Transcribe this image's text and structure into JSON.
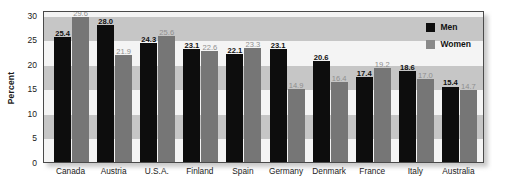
{
  "chart_data": {
    "type": "bar",
    "title": "",
    "subtitle": "",
    "xlabel": "",
    "ylabel": "Percent",
    "ylim": [
      0,
      31
    ],
    "yticks": [
      0,
      5,
      10,
      15,
      20,
      25,
      30
    ],
    "ytick_labels": [
      "0",
      "5",
      "10",
      "15",
      "20",
      "25",
      "30"
    ],
    "grid": "alternating horizontal bands every 5 units",
    "legend_position": "top-right inside plot",
    "categories": [
      "Canada",
      "Austria",
      "U.S.A.",
      "Finland",
      "Spain",
      "Germany",
      "Denmark",
      "France",
      "Italy",
      "Australia"
    ],
    "series": [
      {
        "name": "Men",
        "color": "#0d0d0d",
        "values": [
          25.4,
          28.0,
          24.3,
          23.1,
          22.1,
          23.1,
          20.6,
          17.4,
          18.6,
          15.4
        ],
        "labels": [
          "25.4",
          "28.0",
          "24.3",
          "23.1",
          "22.1",
          "23.1",
          "20.6",
          "17.4",
          "18.6",
          "15.4"
        ]
      },
      {
        "name": "Women",
        "color": "#767676",
        "values": [
          29.6,
          21.9,
          25.6,
          22.6,
          23.3,
          14.9,
          16.4,
          19.2,
          17.0,
          14.7
        ],
        "labels": [
          "29.6",
          "21.9",
          "25.6",
          "22.6",
          "23.3",
          "14.9",
          "16.4",
          "19.2",
          "17.0",
          "14.7"
        ]
      }
    ]
  },
  "legend": {
    "items": [
      {
        "label": "Men",
        "key": "men"
      },
      {
        "label": "Women",
        "key": "women"
      }
    ]
  }
}
